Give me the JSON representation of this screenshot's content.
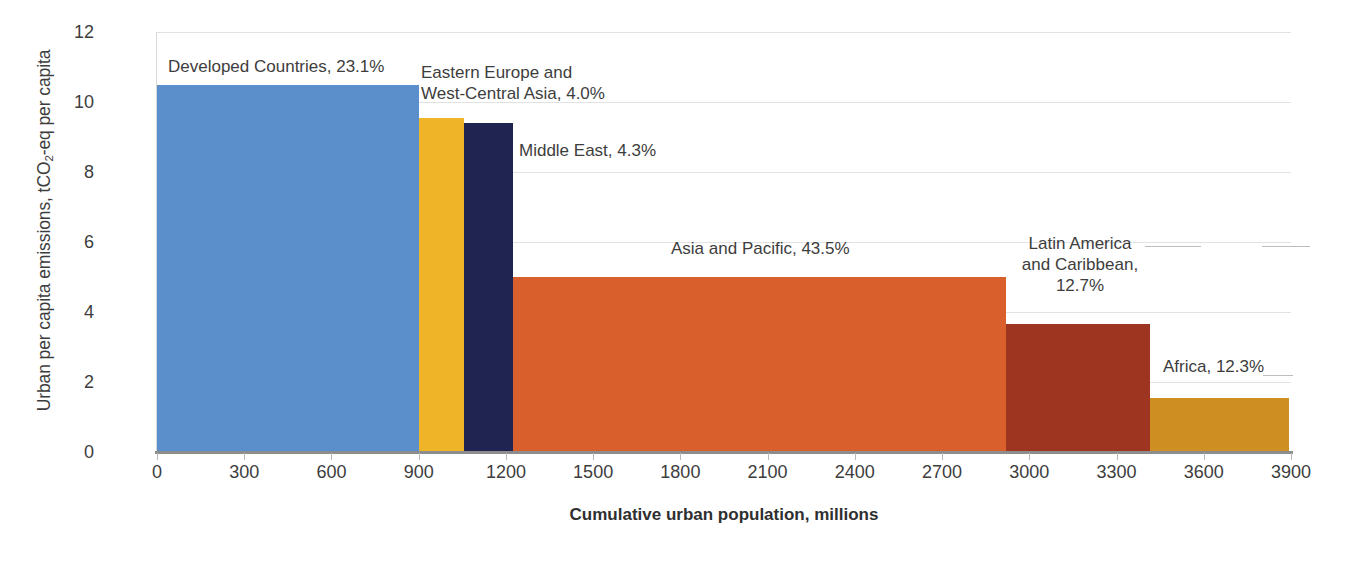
{
  "chart_data": {
    "type": "bar",
    "title": "",
    "subtitle": "",
    "xlabel": "Cumulative urban population, millions",
    "ylabel": "Urban per capita emissions, tCO2-eq per capita",
    "ylabel_parts": {
      "pre": "Urban per capita emissions, tCO",
      "sub": "2",
      "post": "-eq per capita"
    },
    "xlim": [
      0,
      3900
    ],
    "ylim": [
      0,
      12
    ],
    "xticks": [
      0,
      300,
      600,
      900,
      1200,
      1500,
      1800,
      2100,
      2400,
      2700,
      3000,
      3300,
      3600,
      3900
    ],
    "xtick_labels": [
      "0",
      "300",
      "600",
      "900",
      "1200",
      "1500",
      "1800",
      "2100",
      "2400",
      "2700",
      "3000",
      "3300",
      "3600",
      "3900"
    ],
    "yticks": [
      0,
      2,
      4,
      6,
      8,
      10,
      12
    ],
    "ytick_labels": [
      "0",
      "2",
      "4",
      "6",
      "8",
      "10",
      "12"
    ],
    "grid": "horizontal",
    "legend": "none",
    "note": "Marimekko / variable-width bar chart: bar width = share of cumulative urban population, bar height = urban per capita emissions.",
    "series": [
      {
        "name": "Developed Countries",
        "label": "Developed Countries, 23.1%",
        "share_percent": 23.1,
        "x_start": 0,
        "x_end": 900,
        "width_millions": 900,
        "value": 10.5,
        "color": "#5b8fcb"
      },
      {
        "name": "Eastern Europe and West-Central Asia",
        "label": "Eastern Europe and\nWest-Central Asia, 4.0%",
        "share_percent": 4.0,
        "x_start": 900,
        "x_end": 1056,
        "width_millions": 156,
        "value": 9.55,
        "color": "#f0b429"
      },
      {
        "name": "Middle East",
        "label": "Middle East, 4.3%",
        "share_percent": 4.3,
        "x_start": 1056,
        "x_end": 1224,
        "width_millions": 168,
        "value": 9.4,
        "color": "#1f2451"
      },
      {
        "name": "Asia and Pacific",
        "label": "Asia and Pacific, 43.5%",
        "share_percent": 43.5,
        "x_start": 1224,
        "x_end": 2920,
        "width_millions": 1696,
        "value": 5.0,
        "color": "#d9602c"
      },
      {
        "name": "Latin America and Caribbean",
        "label": "Latin America\nand Caribbean,\n12.7%",
        "share_percent": 12.7,
        "x_start": 2920,
        "x_end": 3415,
        "width_millions": 495,
        "value": 3.65,
        "color": "#9e3521"
      },
      {
        "name": "Africa",
        "label": "Africa, 12.3%",
        "share_percent": 12.3,
        "x_start": 3415,
        "x_end": 3894,
        "width_millions": 479,
        "value": 1.55,
        "color": "#cf8e21"
      }
    ],
    "annotations": [
      {
        "text": "Developed Countries, 23.1%",
        "for": "Developed Countries"
      },
      {
        "text": "Eastern Europe and\nWest-Central Asia, 4.0%",
        "for": "Eastern Europe and West-Central Asia"
      },
      {
        "text": "Middle East, 4.3%",
        "for": "Middle East"
      },
      {
        "text": "Asia and Pacific, 43.5%",
        "for": "Asia and Pacific"
      },
      {
        "text": "Latin America\nand Caribbean,\n12.7%",
        "for": "Latin America and Caribbean"
      },
      {
        "text": "Africa, 12.3%",
        "for": "Africa"
      }
    ]
  },
  "labels": {
    "developed": "Developed Countries, 23.1%",
    "eastern_europe": "Eastern Europe and\nWest-Central Asia, 4.0%",
    "middle_east": "Middle East, 4.3%",
    "asia_pacific": "Asia and Pacific, 43.5%",
    "latin_america": "Latin America\nand Caribbean,\n12.7%",
    "africa": "Africa, 12.3%"
  },
  "axis": {
    "x_title": "Cumulative urban population, millions",
    "y_title_pre": "Urban per capita emissions, tCO",
    "y_title_sub": "2",
    "y_title_post": "-eq per capita"
  }
}
